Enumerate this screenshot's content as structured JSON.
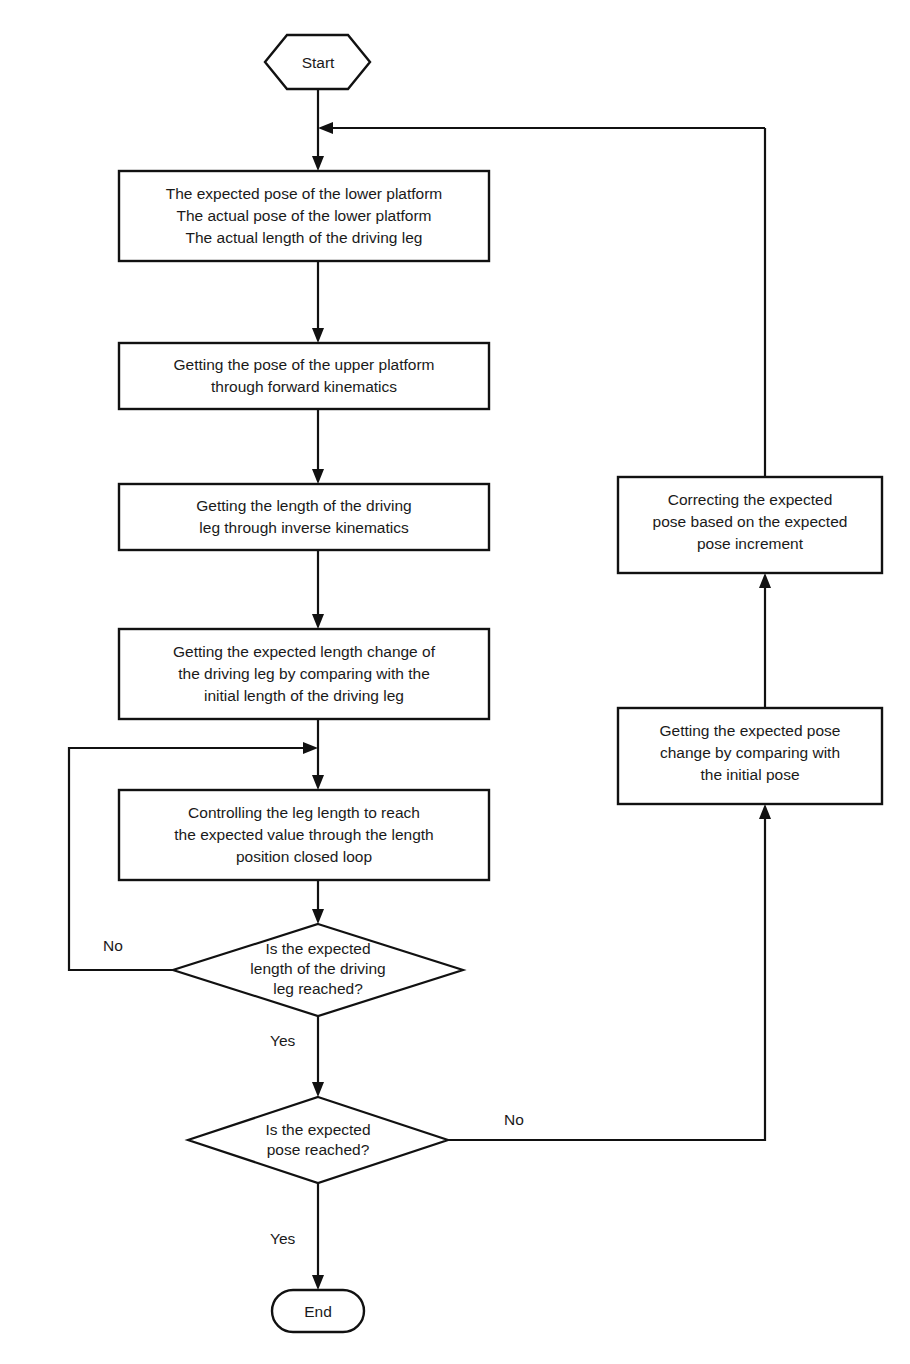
{
  "diagram": {
    "type": "flowchart",
    "background_color": "#ffffff",
    "line_color": "#111111",
    "text_color": "#1a1a1a"
  },
  "nodes": {
    "start": {
      "shape": "hexagon",
      "label": "Start"
    },
    "inputs": {
      "shape": "process",
      "label": "The expected pose of the lower platform\nThe actual pose of the lower platform\nThe actual length of the driving leg"
    },
    "forward_kinematics": {
      "shape": "process",
      "label": "Getting the pose of the upper platform\nthrough forward kinematics"
    },
    "inverse_kinematics": {
      "shape": "process",
      "label": "Getting the length of the driving\nleg through inverse kinematics"
    },
    "expected_length_change": {
      "shape": "process",
      "label": "Getting the expected length change of\nthe driving leg by comparing with the\ninitial length of the driving leg"
    },
    "closed_loop_control": {
      "shape": "process",
      "label": "Controlling the leg length to reach\nthe expected value through the length\nposition closed loop"
    },
    "length_decision": {
      "shape": "decision",
      "label": "Is the expected\nlength of the driving\nleg reached?"
    },
    "pose_decision": {
      "shape": "decision",
      "label": "Is the expected\npose reached?"
    },
    "end": {
      "shape": "terminator",
      "label": "End"
    },
    "correct_pose": {
      "shape": "process",
      "label": "Correcting the expected\npose based on the expected\npose increment"
    },
    "expected_pose_change": {
      "shape": "process",
      "label": "Getting the expected pose\nchange by comparing with\nthe initial pose"
    }
  },
  "edge_labels": {
    "length_no": "No",
    "length_yes": "Yes",
    "pose_no": "No",
    "pose_yes": "Yes"
  }
}
